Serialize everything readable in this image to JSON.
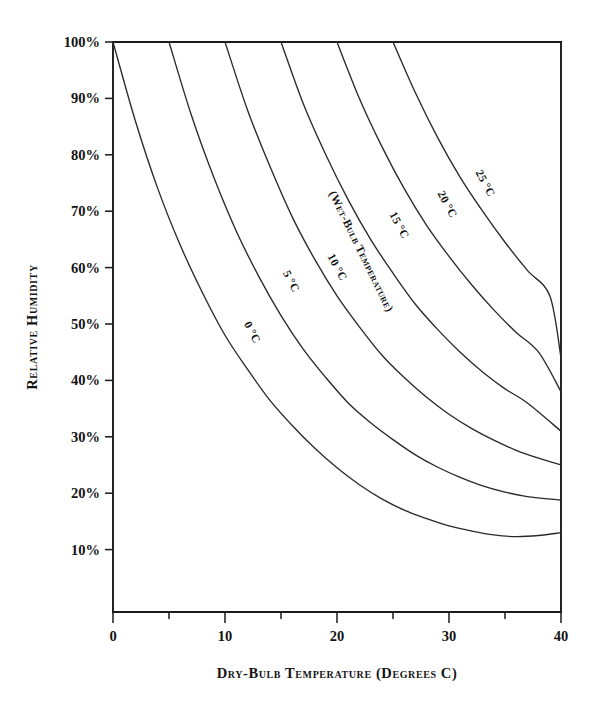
{
  "figure": {
    "kind": "psychrometric-wet-bulb-chart",
    "background_color": "#ffffff",
    "line_color": "#2a2a2a",
    "text_color": "#141414"
  },
  "axes": {
    "x_title": "Dry-Bulb Temperature (Degrees C)",
    "y_title": "Relative Humidity",
    "x_tick_labels": [
      "0",
      "10",
      "20",
      "30",
      "40"
    ],
    "y_tick_labels": [
      "10%",
      "20%",
      "30%",
      "40%",
      "50%",
      "60%",
      "70%",
      "80%",
      "90%",
      "100%"
    ]
  },
  "chart_data": {
    "type": "line",
    "title": "",
    "subtitle": "",
    "xlabel": "Dry-Bulb Temperature (Degrees C)",
    "ylabel": "Relative Humidity",
    "xlim": [
      0,
      40
    ],
    "ylim": [
      0,
      100
    ],
    "x_major_ticks": [
      0,
      10,
      20,
      30,
      40
    ],
    "x_minor_ticks": [
      5,
      15,
      25,
      35
    ],
    "y_major_ticks": [
      10,
      20,
      30,
      40,
      50,
      60,
      70,
      80,
      90,
      100
    ],
    "y_axis_unit": "%",
    "grid": false,
    "legend": "inline-curve-labels",
    "annotation": "(Wet-Bulb Temperature)",
    "series": [
      {
        "name": "0 °C",
        "label": "0 °C",
        "wet_bulb_c": 0,
        "x": [
          0,
          2,
          4,
          6,
          8,
          10,
          12,
          14,
          16,
          18,
          20,
          22,
          24,
          26,
          28,
          30,
          32,
          34,
          36,
          38,
          40
        ],
        "values": [
          100,
          86,
          74,
          64,
          55.5,
          48,
          42,
          36.5,
          32,
          28,
          24.5,
          21.5,
          19,
          17,
          15.5,
          14.2,
          13.3,
          12.6,
          12.3,
          12.5,
          13.0
        ]
      },
      {
        "name": "5 °C",
        "label": "5 °C",
        "wet_bulb_c": 5,
        "x": [
          5,
          7,
          9,
          11,
          13,
          15,
          17,
          19,
          21,
          23,
          25,
          27,
          29,
          31,
          33,
          35,
          37,
          40
        ],
        "values": [
          100,
          87,
          76,
          66.5,
          58.5,
          51.5,
          45.5,
          40.5,
          36,
          32.5,
          29.5,
          26.8,
          24.6,
          22.8,
          21.3,
          20.2,
          19.4,
          18.8
        ]
      },
      {
        "name": "10 °C",
        "label": "10 °C",
        "wet_bulb_c": 10,
        "x": [
          10,
          12,
          14,
          16,
          18,
          20,
          22,
          24,
          26,
          28,
          30,
          32,
          34,
          36,
          38,
          40
        ],
        "values": [
          100,
          88,
          78,
          69,
          61.5,
          55,
          49.5,
          44.5,
          40.5,
          37,
          34,
          31.5,
          29.4,
          27.6,
          26.2,
          25.0
        ]
      },
      {
        "name": "15 °C",
        "label": "15 °C",
        "wet_bulb_c": 15,
        "x": [
          15,
          17,
          19,
          21,
          23,
          25,
          27,
          29,
          31,
          33,
          35,
          37,
          40
        ],
        "values": [
          100,
          89,
          80,
          72,
          65,
          59,
          53.5,
          49,
          45,
          41.5,
          38.5,
          36,
          31.0
        ]
      },
      {
        "name": "20 °C",
        "label": "20 °C",
        "wet_bulb_c": 20,
        "x": [
          20,
          22,
          24,
          26,
          28,
          30,
          32,
          34,
          36,
          38,
          40
        ],
        "values": [
          100,
          90,
          81.5,
          74,
          67.5,
          62,
          57,
          52.5,
          48.5,
          45,
          38.0
        ]
      },
      {
        "name": "25 °C",
        "label": "25 °C",
        "wet_bulb_c": 25,
        "x": [
          25,
          27,
          29,
          31,
          33,
          35,
          37,
          39,
          40
        ],
        "values": [
          100,
          91,
          83,
          76,
          70,
          64.5,
          59.5,
          55,
          44.0
        ]
      }
    ]
  }
}
